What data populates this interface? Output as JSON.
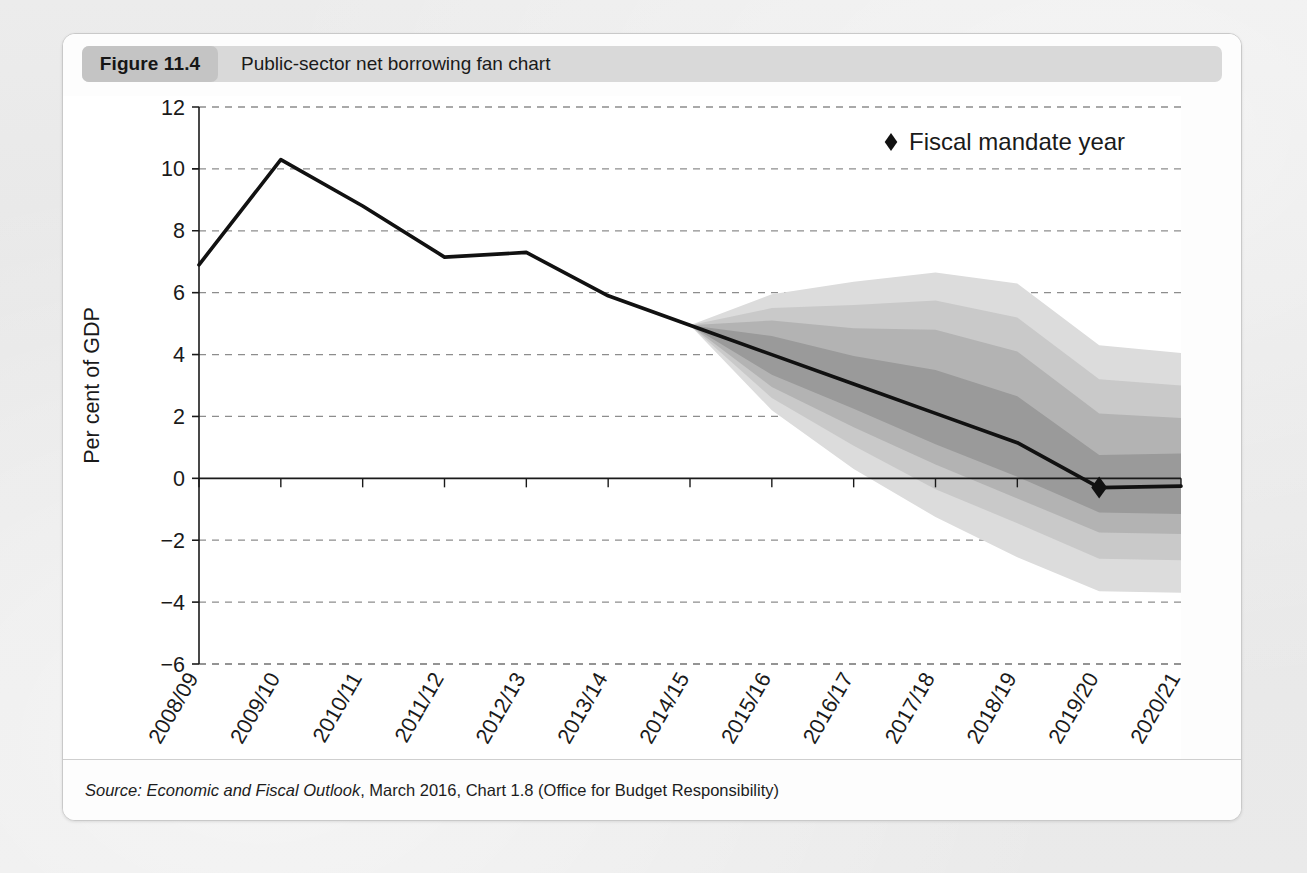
{
  "page": {
    "background_color": "#e9e9e9",
    "card_background": "#fdfdfd"
  },
  "header": {
    "figure_number": "Figure 11.4",
    "title": "Public-sector net borrowing fan chart",
    "pill_color": "#d9d9d9",
    "number_pill_color": "#c4c4c4"
  },
  "source": {
    "label": "Source:",
    "italic_part": "Economic and Fiscal Outlook",
    "rest": ", March 2016, Chart 1.8 (Office for Budget Responsibility)"
  },
  "legend": {
    "items": [
      {
        "marker": "diamond-marker",
        "label": "Fiscal mandate year",
        "color": "#111111"
      }
    ]
  },
  "axes": {
    "ylabel": "Per cent of GDP",
    "yticks": [
      12,
      10,
      8,
      6,
      4,
      2,
      0,
      -2,
      -4,
      -6
    ],
    "ytick_labels": [
      "12",
      "10",
      "8",
      "6",
      "4",
      "2",
      "0",
      "−2",
      "−4",
      "−6"
    ],
    "ylim": [
      -6,
      12
    ],
    "gridline_color": "#8d8d8d",
    "grid": true,
    "zero_line_color": "#1a1a1a"
  },
  "chart_data": {
    "type": "line",
    "title": "Public-sector net borrowing fan chart",
    "xlabel": "",
    "ylabel": "Per cent of GDP",
    "ylim": [
      -6,
      12
    ],
    "grid": true,
    "legend_position": "top-right",
    "categories": [
      "2008/09",
      "2009/10",
      "2010/11",
      "2011/12",
      "2012/13",
      "2013/14",
      "2014/15",
      "2015/16",
      "2016/17",
      "2017/18",
      "2018/19",
      "2019/20",
      "2020/21"
    ],
    "series": [
      {
        "name": "Public-sector net borrowing (central projection)",
        "color": "#111111",
        "values": [
          6.9,
          10.3,
          8.8,
          7.15,
          7.3,
          5.9,
          4.95,
          4.0,
          3.05,
          2.1,
          1.15,
          -0.3,
          -0.25
        ]
      }
    ],
    "fan_bands": [
      {
        "name": "outer-band",
        "fill": "#dcdcdc",
        "upper": [
          null,
          null,
          null,
          null,
          null,
          null,
          4.95,
          5.95,
          6.35,
          6.65,
          6.3,
          4.3,
          4.05
        ],
        "lower": [
          null,
          null,
          null,
          null,
          null,
          null,
          4.95,
          2.2,
          0.3,
          -1.25,
          -2.55,
          -3.65,
          -3.7
        ]
      },
      {
        "name": "second-band",
        "fill": "#c9c9c9",
        "upper": [
          null,
          null,
          null,
          null,
          null,
          null,
          4.95,
          5.5,
          5.6,
          5.75,
          5.2,
          3.2,
          3.0
        ],
        "lower": [
          null,
          null,
          null,
          null,
          null,
          null,
          4.95,
          2.6,
          1.05,
          -0.35,
          -1.45,
          -2.6,
          -2.65
        ]
      },
      {
        "name": "third-band",
        "fill": "#b3b3b3",
        "upper": [
          null,
          null,
          null,
          null,
          null,
          null,
          4.95,
          5.1,
          4.85,
          4.8,
          4.1,
          2.1,
          1.95
        ],
        "lower": [
          null,
          null,
          null,
          null,
          null,
          null,
          4.95,
          2.95,
          1.65,
          0.45,
          -0.65,
          -1.75,
          -1.8
        ]
      },
      {
        "name": "inner-band",
        "fill": "#9a9a9a",
        "upper": [
          null,
          null,
          null,
          null,
          null,
          null,
          4.95,
          4.6,
          3.95,
          3.5,
          2.65,
          0.75,
          0.8
        ],
        "lower": [
          null,
          null,
          null,
          null,
          null,
          null,
          4.95,
          3.35,
          2.25,
          1.1,
          0.05,
          -1.1,
          -1.15
        ]
      }
    ],
    "markers": [
      {
        "name": "fiscal-mandate-year",
        "category": "2019/20",
        "value": -0.3,
        "shape": "diamond",
        "color": "#111111"
      }
    ],
    "forecast_start_category": "2014/15"
  }
}
